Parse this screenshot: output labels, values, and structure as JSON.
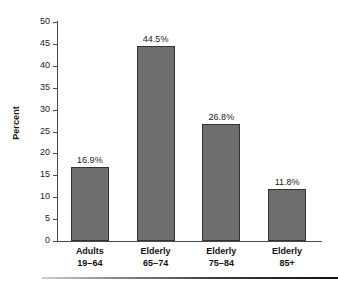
{
  "chart_data": {
    "type": "bar",
    "title": "",
    "xlabel": "",
    "ylabel": "Percent",
    "ylim": [
      0,
      50
    ],
    "ytick_step": 5,
    "grid": false,
    "legend": "none",
    "categories": [
      {
        "line1": "Adults",
        "line2": "19–64"
      },
      {
        "line1": "Elderly",
        "line2": "65–74"
      },
      {
        "line1": "Elderly",
        "line2": "75–84"
      },
      {
        "line1": "Elderly",
        "line2": "85+"
      }
    ],
    "values": [
      16.9,
      44.5,
      26.8,
      11.8
    ],
    "value_labels": [
      "16.9%",
      "44.5%",
      "26.8%",
      "11.8%"
    ],
    "ytick_labels": [
      "0",
      "5",
      "10",
      "15",
      "20",
      "25",
      "30",
      "35",
      "40",
      "45",
      "50"
    ],
    "bar_color": "#6e6e6e",
    "bar_edge_color": "#333333",
    "axis_color": "#4a4a4a",
    "background_color": "#ffffff"
  }
}
